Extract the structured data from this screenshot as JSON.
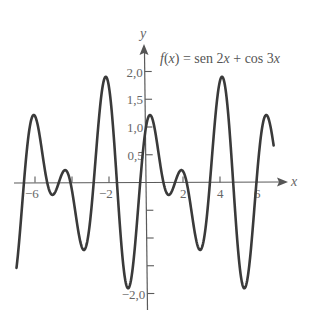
{
  "chart_data": {
    "type": "line",
    "title": "f(x) = sen 2x + cos 3x",
    "title_parts": {
      "f": "f",
      "open": "(",
      "x1": "x",
      "close": ") = sen 2",
      "x2": "x",
      "plus": " + cos 3",
      "x3": "x"
    },
    "function": "sin(2x) + cos(3x)",
    "xlabel": "x",
    "ylabel": "y",
    "xlim": [
      -7,
      6.9
    ],
    "ylim": [
      -2.0,
      2.0
    ],
    "grid": false,
    "legend": "none",
    "x_ticks": [
      -6,
      -4,
      -2,
      2,
      4,
      6
    ],
    "x_tick_labels": [
      {
        "value": -6,
        "label": "-6"
      },
      {
        "value": -2,
        "label": "-2"
      },
      {
        "value": 2,
        "label": "2"
      },
      {
        "value": 4,
        "label": "4"
      },
      {
        "value": 6,
        "label": "6"
      }
    ],
    "y_ticks": [
      2.0,
      1.5,
      1.0,
      0.5,
      -0.5,
      -1.0,
      -1.5,
      -2.0
    ],
    "y_tick_labels": [
      {
        "value": 2.0,
        "label": "2,0"
      },
      {
        "value": 1.5,
        "label": "1,5"
      },
      {
        "value": 1.0,
        "label": "1,0"
      },
      {
        "value": 0.5,
        "label": "0,5"
      },
      {
        "value": -2.0,
        "label": "-2,0"
      }
    ],
    "series": [
      {
        "name": "f(x) = sen 2x + cos 3x",
        "x": [
          -7,
          -6.5,
          -6,
          -5.5,
          -5,
          -4.5,
          -4,
          -3.5,
          -3,
          -2.5,
          -2,
          -1.5,
          -1,
          -0.5,
          0,
          0.5,
          1,
          1.5,
          2,
          2.5,
          3,
          3.5,
          4,
          4.5,
          5,
          5.5,
          6,
          6.5,
          6.9
        ],
        "y": [
          -1.54,
          0.38,
          1.2,
          0.29,
          -0.22,
          0.18,
          -0.15,
          -1.13,
          -0.63,
          1.31,
          1.72,
          -0.35,
          -1.9,
          -0.77,
          1.0,
          0.91,
          -0.08,
          -0.07,
          0.2,
          -0.61,
          -1.19,
          0.18,
          1.83,
          1.01,
          -1.3,
          -1.71,
          0.12,
          1.22,
          0.67
        ]
      }
    ]
  }
}
